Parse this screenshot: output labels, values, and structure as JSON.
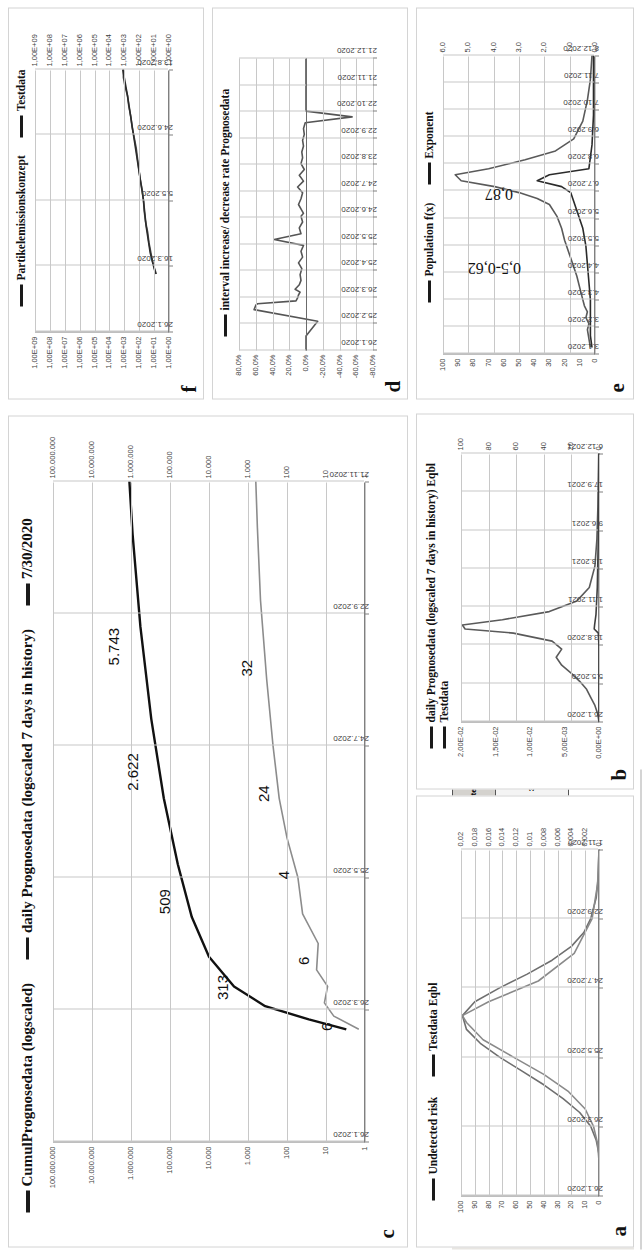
{
  "header": {
    "title": "Alaska",
    "selector_value": "Alaska",
    "play_button": "▶"
  },
  "indicators": {
    "left_pct": "99%",
    "mid_pct": "99%",
    "right_pct": "99%",
    "value_085": "0,85",
    "value_083": "0,83"
  },
  "table": {
    "columns": [
      {
        "header": "IntervalNo",
        "value": "5,0"
      },
      {
        "header": "Interval in days",
        "value": "31"
      },
      {
        "header": "Number of days",
        "value": "155"
      }
    ],
    "rows": [
      {
        "header": "Maximum Infected on interval at",
        "values": [
          "86",
          "30.7.2020"
        ]
      },
      {
        "header": "Minimum of daily infective contacts",
        "value": "13,60"
      },
      {
        "header": "Preview until",
        "value": "15.8.2020"
      }
    ],
    "cells": {
      "intervalno_label": "IntervalNo",
      "intervalno_value": "5,0",
      "interval_days_label": "Interval in days",
      "interval_days_value": "31",
      "number_days_label": "Number of days",
      "number_days_value": "155",
      "max_infected_label": "Maximum Infected on interval at",
      "max_infected_value": "86",
      "max_infected_date": "30.7.2020",
      "min_contacts_label": "Minimum of daily infective contacts",
      "min_contacts_value": "13,60",
      "preview_label": "Preview until",
      "preview_value": "15.8.2020"
    }
  },
  "chart_data": [
    {
      "id": "a",
      "type": "line",
      "title": "",
      "legend": [
        "Undetected risk",
        "Testdata Eqbl"
      ],
      "legend_position": "top",
      "ylabel_left": "",
      "ylabel_right": "",
      "yticks_left": [
        "100",
        "90",
        "80",
        "70",
        "60",
        "50",
        "40",
        "30",
        "20",
        "10",
        "0"
      ],
      "yticks_right": [
        "0,02",
        "0,018",
        "0,016",
        "0,014",
        "0,012",
        "0,01",
        "0,008",
        "0,006",
        "0,004",
        "0,002",
        "0"
      ],
      "xticks": [
        "26.1.2020",
        "26.3.2020",
        "25.5.2020",
        "24.7.2020",
        "22.9.2020",
        "1.11.2020"
      ],
      "ylim": [
        0,
        100
      ],
      "grid": true,
      "series": [
        {
          "name": "Undetected risk",
          "color": "#6f6f6f",
          "x": [
            0,
            0.04,
            0.08,
            0.12,
            0.16,
            0.2,
            0.24,
            0.28,
            0.32,
            0.36,
            0.4,
            0.44,
            0.48,
            0.52,
            0.56,
            0.6,
            0.64,
            0.68,
            0.72,
            0.76,
            0.8,
            0.86,
            0.92,
            1.0
          ],
          "y": [
            0,
            0,
            0,
            0,
            2,
            6,
            14,
            26,
            40,
            56,
            72,
            86,
            96,
            99,
            90,
            72,
            52,
            34,
            20,
            11,
            6,
            2,
            0.6,
            0
          ]
        },
        {
          "name": "Testdata Eqbl",
          "color": "#8a8a8a",
          "x": [
            0,
            0.05,
            0.1,
            0.15,
            0.2,
            0.25,
            0.3,
            0.35,
            0.4,
            0.45,
            0.5,
            0.52,
            0.56,
            0.62,
            0.7,
            0.8,
            0.9,
            1.0
          ],
          "y": [
            0,
            0,
            0,
            1,
            4,
            10,
            22,
            40,
            62,
            84,
            96,
            99,
            80,
            44,
            18,
            5,
            1,
            0
          ]
        }
      ]
    },
    {
      "id": "b",
      "type": "line",
      "title": "",
      "legend": [
        "daily Prognosedata (logscaled 7 days in history) Eqbl",
        "Testdata"
      ],
      "legend_position": "top",
      "yticks_left": [
        "2,00E-02",
        "1,50E-02",
        "1,00E-02",
        "5,00E-03",
        "0,00E+00"
      ],
      "yticks_right": [
        "100",
        "80",
        "60",
        "40",
        "20",
        "0"
      ],
      "xticks": [
        "26.1.2020",
        "5.5.2020",
        "13.8.2020",
        "1.11.2021",
        "1.3.2021",
        "9.6.2021",
        "17.9.2021",
        "6.12.2021"
      ],
      "ylim": [
        0,
        100
      ],
      "grid": true,
      "series": [
        {
          "name": "daily Prognosedata",
          "color": "#5a5a5a",
          "x": [
            0,
            0.03,
            0.06,
            0.09,
            0.12,
            0.15,
            0.18,
            0.21,
            0.24,
            0.27,
            0.3,
            0.33,
            0.345,
            0.36,
            0.38,
            0.41,
            0.45,
            0.5,
            0.58,
            0.68,
            0.8,
            0.92,
            1.0
          ],
          "y": [
            0,
            1,
            3,
            6,
            9,
            14,
            20,
            27,
            31,
            27,
            34,
            62,
            97,
            99,
            70,
            36,
            16,
            7,
            3,
            1.5,
            0.8,
            0.4,
            0.2
          ]
        },
        {
          "name": "Testdata",
          "color": "#3f3f3f",
          "x": [
            0,
            0.1,
            0.2,
            0.28,
            0.33,
            0.345,
            0.36,
            0.4,
            0.5,
            0.7,
            1.0
          ],
          "y": [
            0,
            0,
            0,
            0,
            0.5,
            3.5,
            3.2,
            2.2,
            1.2,
            0.4,
            0.1
          ]
        }
      ]
    },
    {
      "id": "c",
      "type": "line",
      "title": "",
      "legend": [
        "CumulPrognosedata (logscaled)",
        "daily Prognosedata (logscaled 7 days in history)",
        "7/30/2020"
      ],
      "legend_position": "top",
      "log": true,
      "yticks_left": [
        "100.000.000",
        "10.000.000",
        "1.000.000",
        "100.000",
        "10.000",
        "1.000",
        "100",
        "10",
        "1"
      ],
      "yticks_right": [
        "100.000.000",
        "10.000.000",
        "1.000.000",
        "100.000",
        "10.000",
        "1.000",
        "100",
        "10",
        "1"
      ],
      "xticks": [
        "26.1.2020",
        "26.3.2020",
        "25.5.2020",
        "24.7.2020",
        "22.9.2020",
        "21.11.2020"
      ],
      "grid": true,
      "data_labels": [
        "6",
        "313",
        "6",
        "509",
        "4",
        "24",
        "2.622",
        "32",
        "5.743"
      ],
      "series": [
        {
          "name": "CumulPrognosedata (logscaled)",
          "color": "#111111",
          "points": [
            [
              0.17,
              0.06
            ],
            [
              0.185,
              0.18
            ],
            [
              0.205,
              0.32
            ],
            [
              0.235,
              0.42
            ],
            [
              0.28,
              0.5
            ],
            [
              0.34,
              0.555
            ],
            [
              0.42,
              0.6
            ],
            [
              0.52,
              0.645
            ],
            [
              0.64,
              0.685
            ],
            [
              0.78,
              0.72
            ],
            [
              0.92,
              0.745
            ],
            [
              1.0,
              0.755
            ]
          ]
        },
        {
          "name": "daily Prognosedata (logscaled 7 days in history)",
          "color": "#8c8c8c",
          "points": [
            [
              0.17,
              0.02
            ],
            [
              0.19,
              0.1
            ],
            [
              0.21,
              0.13
            ],
            [
              0.235,
              0.12
            ],
            [
              0.26,
              0.155
            ],
            [
              0.3,
              0.15
            ],
            [
              0.345,
              0.2
            ],
            [
              0.4,
              0.215
            ],
            [
              0.46,
              0.25
            ],
            [
              0.52,
              0.275
            ],
            [
              0.6,
              0.295
            ],
            [
              0.7,
              0.315
            ],
            [
              0.82,
              0.335
            ],
            [
              0.93,
              0.345
            ],
            [
              1.0,
              0.35
            ]
          ]
        }
      ]
    },
    {
      "id": "d",
      "type": "line",
      "title": "",
      "legend": [
        "interval increase/ decrease rate Prognosedata"
      ],
      "legend_position": "top",
      "yticks_left": [
        "80,0%",
        "60,0%",
        "40,0%",
        "20,0%",
        "0,0%",
        "-20,0%",
        "-40,0%",
        "-60,0%",
        "-80,0%"
      ],
      "ylim": [
        -80,
        80
      ],
      "xticks": [
        "26.1.2020",
        "25.2.2020",
        "26.3.2020",
        "25.4.2020",
        "25.5.2020",
        "24.6.2020",
        "24.7.2020",
        "23.8.2020",
        "22.9.2020",
        "22.10.2020",
        "21.11.2020",
        "21.12.2020"
      ],
      "grid": true,
      "series": [
        {
          "name": "interval increase/ decrease rate Prognosedata",
          "color": "#555555",
          "x": [
            0.0,
            0.02,
            0.05,
            0.1,
            0.14,
            0.155,
            0.16,
            0.17,
            0.18,
            0.19,
            0.2,
            0.21,
            0.225,
            0.24,
            0.26,
            0.28,
            0.3,
            0.32,
            0.34,
            0.36,
            0.38,
            0.4,
            0.42,
            0.44,
            0.46,
            0.47,
            0.48,
            0.5,
            0.52,
            0.54,
            0.56,
            0.58,
            0.6,
            0.62,
            0.64,
            0.66,
            0.68,
            0.7,
            0.72,
            0.74,
            0.76,
            0.78,
            0.8,
            0.82,
            0.84,
            0.86,
            0.88,
            0.9,
            0.92,
            0.94,
            0.96,
            0.98,
            1.0
          ],
          "y": [
            0,
            0,
            0,
            -14,
            62,
            60,
            58,
            12,
            10,
            9,
            7,
            13,
            8,
            6,
            7,
            5,
            9,
            4,
            6,
            3,
            38,
            6,
            8,
            4,
            6,
            3,
            5,
            9,
            6,
            4,
            10,
            3,
            8,
            2,
            6,
            4,
            5,
            3,
            4,
            2,
            3,
            1,
            -55,
            0,
            0,
            0,
            0,
            0,
            0,
            0,
            0,
            0,
            0
          ]
        }
      ]
    },
    {
      "id": "e",
      "type": "line",
      "title": "",
      "legend": [
        "Population f(x)",
        "Exponent"
      ],
      "legend_position": "top",
      "yticks_left": [
        "100",
        "90",
        "80",
        "70",
        "60",
        "50",
        "40",
        "30",
        "20",
        "10",
        "0"
      ],
      "yticks_right": [
        "6,0",
        "5,0",
        "4,0",
        "3,0",
        "2,0",
        "1,0",
        "0,0"
      ],
      "xticks": [
        "3.1.2020",
        "3.2.2020",
        "4.3.2020",
        "4.4.2020",
        "5.5.2020",
        "5.6.2020",
        "6.7.2020",
        "6.8.2020",
        "6.9.2020",
        "7.10.2020",
        "7.11.2020",
        "8.12.2020"
      ],
      "ylim": [
        0,
        100
      ],
      "grid": true,
      "annotations": [
        "0,5-0,62",
        "0,87"
      ],
      "series": [
        {
          "name": "Population f(x)",
          "color": "#5a5a5a",
          "x": [
            0.02,
            0.05,
            0.08,
            0.1,
            0.12,
            0.14,
            0.16,
            0.2,
            0.26,
            0.32,
            0.38,
            0.42,
            0.46,
            0.5,
            0.52,
            0.54,
            0.56,
            0.58,
            0.6,
            0.62,
            0.65,
            0.68,
            0.72,
            0.78,
            0.85,
            0.92,
            1.0
          ],
          "y": [
            3,
            4,
            5,
            4,
            6,
            5,
            7,
            9,
            12,
            16,
            20,
            22,
            25,
            30,
            38,
            50,
            66,
            88,
            92,
            70,
            46,
            26,
            14,
            8,
            5,
            3,
            2
          ]
        },
        {
          "name": "Exponent",
          "color": "#2b2b2b",
          "x": [
            0.02,
            0.06,
            0.1,
            0.14,
            0.18,
            0.24,
            0.3,
            0.36,
            0.42,
            0.48,
            0.54,
            0.56,
            0.58,
            0.6,
            0.62,
            0.7,
            0.8,
            0.9,
            1.0
          ],
          "y": [
            2,
            3,
            3,
            3,
            3,
            4,
            5,
            6,
            8,
            12,
            16,
            22,
            38,
            30,
            4,
            2,
            1,
            1,
            1
          ]
        }
      ]
    },
    {
      "id": "f",
      "type": "line",
      "title": "",
      "legend": [
        "Partikelemissionskonzept",
        "Testdata"
      ],
      "legend_position": "top",
      "log": true,
      "yticks_left": [
        "1,00E+09",
        "1,00E+08",
        "1,00E+07",
        "1,00E+06",
        "1,00E+05",
        "1,00E+04",
        "1,00E+03",
        "1,00E+02",
        "1,00E+01",
        "1,00E+00"
      ],
      "yticks_right": [
        "1,00E+09",
        "1,00E+08",
        "1,00E+07",
        "1,00E+06",
        "1,00E+05",
        "1,00E+04",
        "1,00E+03",
        "1,00E+02",
        "1,00E+01",
        "1,00E+00"
      ],
      "xticks": [
        "26.1.2020",
        "16.3.2020",
        "5.5.2020",
        "24.6.2020",
        "13.8.2020"
      ],
      "grid": true,
      "series": [
        {
          "name": "Partikelemissionskonzept",
          "color": "#4a4a4a",
          "points": [
            [
              0.22,
              0.095
            ],
            [
              0.26,
              0.12
            ],
            [
              0.3,
              0.135
            ],
            [
              0.34,
              0.15
            ],
            [
              0.38,
              0.16
            ],
            [
              0.42,
              0.175
            ],
            [
              0.46,
              0.185
            ],
            [
              0.5,
              0.19
            ],
            [
              0.54,
              0.2
            ],
            [
              0.58,
              0.215
            ],
            [
              0.62,
              0.225
            ],
            [
              0.66,
              0.235
            ],
            [
              0.7,
              0.245
            ],
            [
              0.74,
              0.26
            ],
            [
              0.78,
              0.275
            ],
            [
              0.82,
              0.285
            ],
            [
              0.86,
              0.3
            ],
            [
              0.9,
              0.31
            ],
            [
              0.94,
              0.33
            ],
            [
              0.97,
              0.34
            ],
            [
              1.0,
              0.34
            ]
          ]
        },
        {
          "name": "Testdata",
          "color": "#2b2b2b",
          "points": [
            [
              0.22,
              0.1
            ],
            [
              0.3,
              0.14
            ],
            [
              0.4,
              0.17
            ],
            [
              0.5,
              0.19
            ],
            [
              0.6,
              0.22
            ],
            [
              0.7,
              0.25
            ],
            [
              0.8,
              0.28
            ],
            [
              0.9,
              0.31
            ],
            [
              1.0,
              0.345
            ]
          ]
        }
      ]
    }
  ]
}
